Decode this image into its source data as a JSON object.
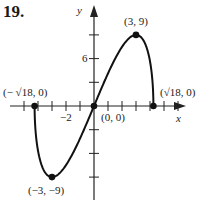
{
  "problem_number": "19.",
  "chart_data": {
    "type": "line",
    "title": "",
    "xlabel": "x",
    "ylabel": "y",
    "xlim": [
      -4.5,
      6.4
    ],
    "ylim": [
      -12,
      13
    ],
    "x_tick_step": 1,
    "y_tick_step": 3,
    "tick_labels": {
      "x": [
        "-2"
      ],
      "y": [
        "6"
      ]
    },
    "grid": false,
    "legend": null,
    "function_description": "y = x * sqrt(18 - x^2)",
    "points": [
      {
        "x": -4.243,
        "y": 0,
        "label": "(− √18, 0)"
      },
      {
        "x": -3,
        "y": -9,
        "label": "(−3, −9)"
      },
      {
        "x": 0,
        "y": 0,
        "label": "(0, 0)"
      },
      {
        "x": 3,
        "y": 9,
        "label": "(3, 9)"
      },
      {
        "x": 4.243,
        "y": 0,
        "label": "(√18, 0)"
      }
    ]
  },
  "labels": {
    "x_axis": "x",
    "y_axis": "y",
    "tick_minus2": "−2",
    "tick_6": "6",
    "pt_neg_sqrt18": "(− √18, 0)",
    "pt_min": "(−3, −9)",
    "pt_origin": "(0, 0)",
    "pt_max": "(3, 9)",
    "pt_sqrt18": "(√18, 0)"
  }
}
